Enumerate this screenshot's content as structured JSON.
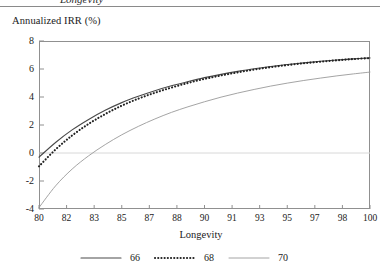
{
  "figure": {
    "top_clipped_text": "Longevity",
    "y_axis_title": "Annualized IRR (%)",
    "x_axis_title": "Longevity"
  },
  "chart_data": {
    "type": "line",
    "title": "",
    "xlabel": "Longevity",
    "ylabel": "Annualized IRR (%)",
    "xlim": [
      80,
      100
    ],
    "ylim": [
      -4,
      8
    ],
    "grid": "zero-line-only",
    "legend_position": "bottom-center",
    "x_tick_labels": [
      "80",
      "82",
      "83",
      "85",
      "87",
      "88",
      "90",
      "91",
      "93",
      "95",
      "97",
      "98",
      "100"
    ],
    "y_tick_labels": [
      "8",
      "6",
      "4",
      "2",
      "0",
      "-2",
      "-4"
    ],
    "y_ticks": [
      8,
      6,
      4,
      2,
      0,
      -2,
      -4
    ],
    "x": [
      80,
      81,
      82,
      83,
      84,
      85,
      86,
      87,
      88,
      89,
      90,
      91,
      92,
      93,
      94,
      95,
      96,
      97,
      98,
      99,
      100
    ],
    "series": [
      {
        "name": "66",
        "style": "solid",
        "color": "#4a4a4a",
        "values": [
          -0.3,
          0.75,
          1.65,
          2.4,
          3.05,
          3.6,
          4.05,
          4.45,
          4.8,
          5.1,
          5.38,
          5.62,
          5.83,
          6.02,
          6.18,
          6.32,
          6.44,
          6.55,
          6.64,
          6.72,
          6.79
        ]
      },
      {
        "name": "68",
        "style": "dotted",
        "color": "#222222",
        "values": [
          -0.95,
          0.25,
          1.25,
          2.08,
          2.78,
          3.38,
          3.88,
          4.3,
          4.67,
          5.0,
          5.29,
          5.54,
          5.76,
          5.96,
          6.13,
          6.28,
          6.41,
          6.52,
          6.62,
          6.71,
          6.78
        ]
      },
      {
        "name": "70",
        "style": "solid-light",
        "color": "#9a9a9a",
        "values": [
          -3.9,
          -2.35,
          -1.15,
          -0.2,
          0.6,
          1.3,
          1.9,
          2.43,
          2.9,
          3.3,
          3.66,
          3.99,
          4.28,
          4.54,
          4.78,
          4.99,
          5.18,
          5.35,
          5.51,
          5.65,
          5.78
        ]
      }
    ]
  },
  "legend": {
    "items": [
      {
        "label": "66",
        "style": "solid"
      },
      {
        "label": "68",
        "style": "dotted"
      },
      {
        "label": "70",
        "style": "solid-light"
      }
    ]
  },
  "colors": {
    "series_66": "#4a4a4a",
    "series_68": "#222222",
    "series_70": "#9a9a9a",
    "frame": "#909090",
    "zero_line": "#d8d8d8",
    "text": "#1a1a1a"
  }
}
